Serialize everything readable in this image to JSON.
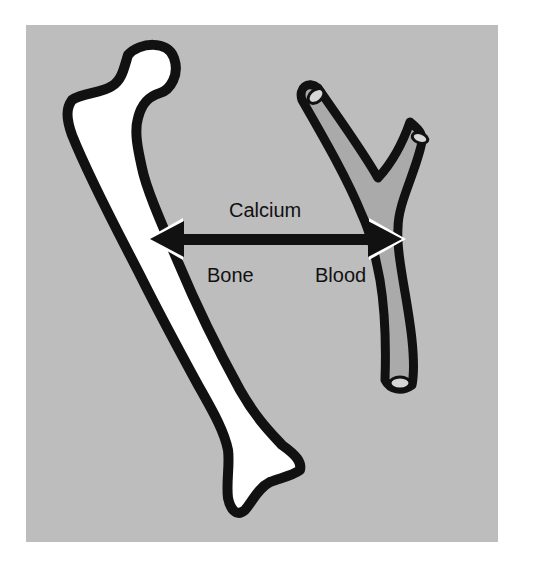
{
  "diagram": {
    "labels": {
      "exchange": "Calcium",
      "left_compartment": "Bone",
      "right_compartment": "Blood"
    },
    "shapes": {
      "left": "femur-bone",
      "right": "branching-blood-vessel",
      "connector": "double-headed-arrow"
    },
    "colors": {
      "background": "#bdbdbd",
      "bone_fill": "#ffffff",
      "vessel_fill": "#aaaaaa",
      "outline": "#111111",
      "page": "#ffffff"
    }
  }
}
